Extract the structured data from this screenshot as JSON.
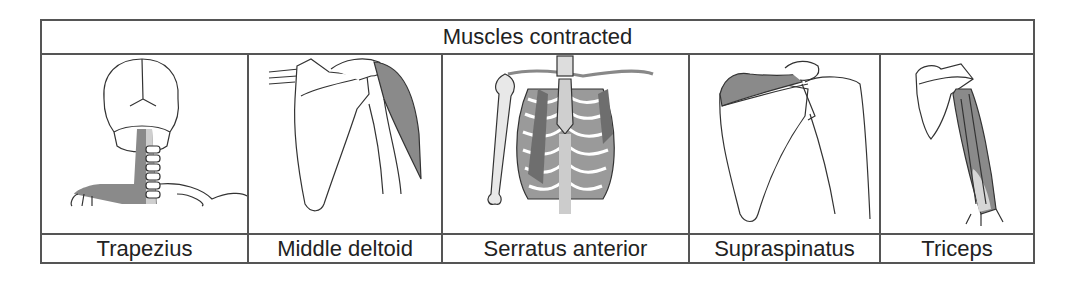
{
  "table": {
    "header": "Muscles contracted",
    "columns": [
      {
        "label": "Trapezius",
        "illustration": "trapezius-illustration"
      },
      {
        "label": "Middle deltoid",
        "illustration": "middle-deltoid-illustration"
      },
      {
        "label": "Serratus anterior",
        "illustration": "serratus-anterior-illustration"
      },
      {
        "label": "Supraspinatus",
        "illustration": "supraspinatus-illustration"
      },
      {
        "label": "Triceps",
        "illustration": "triceps-illustration"
      }
    ]
  },
  "colors": {
    "border": "#555555",
    "muscle_fill": "#8a8a8a",
    "bone_stroke": "#333333",
    "text": "#222222"
  }
}
